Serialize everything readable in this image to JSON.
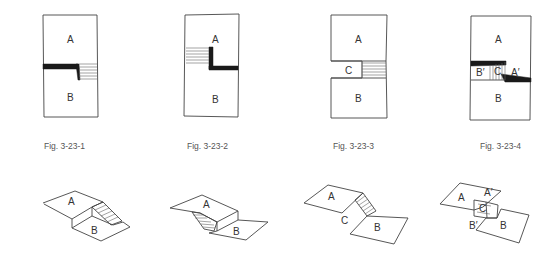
{
  "figures": [
    {
      "id": "fig-3-23-1",
      "caption": "Fig. 3-23-1",
      "plan_labels": {
        "a": "A",
        "b": "B"
      },
      "iso_labels": {
        "a": "A",
        "b": "B"
      }
    },
    {
      "id": "fig-3-23-2",
      "caption": "Fig. 3-23-2",
      "plan_labels": {
        "a": "A",
        "b": "B"
      },
      "iso_labels": {
        "a": "A",
        "b": "B"
      }
    },
    {
      "id": "fig-3-23-3",
      "caption": "Fig. 3-23-3",
      "plan_labels": {
        "a": "A",
        "b": "B",
        "c": "C"
      },
      "iso_labels": {
        "a": "A",
        "b": "B",
        "c": "C"
      }
    },
    {
      "id": "fig-3-23-4",
      "caption": "Fig. 3-23-4",
      "plan_labels": {
        "a": "A",
        "b": "B",
        "c": "C",
        "a_prime": "A′",
        "b_prime": "B′"
      },
      "iso_labels": {
        "a": "A",
        "b": "B",
        "c": "C",
        "a_prime": "A′",
        "b_prime": "B′"
      }
    }
  ],
  "colors": {
    "line": "#444444",
    "fill_dark": "#1a1a1a",
    "caption": "#555555",
    "background": "#ffffff"
  }
}
